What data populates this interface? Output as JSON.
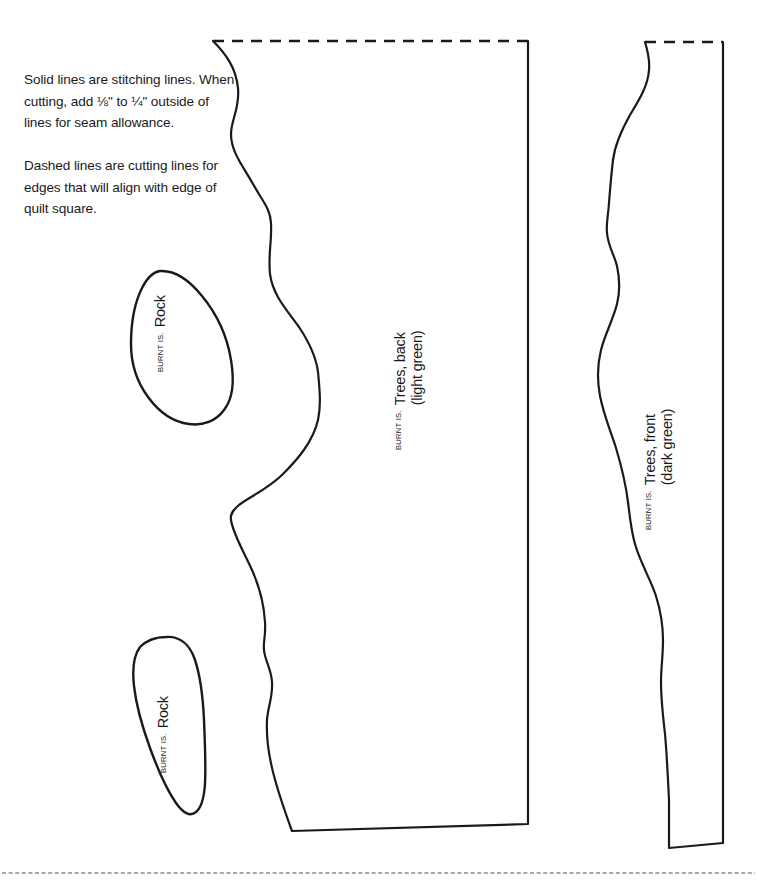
{
  "page": {
    "background": "#ffffff",
    "ink": "#1a1a1a",
    "width": 757,
    "height": 892
  },
  "instructions": {
    "paragraph_1": "Solid lines are stitching lines. When cutting, add ⅛\" to ¼\" outside of lines for seam allowance.",
    "paragraph_2": "Dashed lines are cutting lines for edges that will align with edge of quilt square."
  },
  "pieces": [
    {
      "id": "rock-top",
      "collection": "BURNT IS.",
      "name": "Rock",
      "color_note": "",
      "edges": {
        "solid": true,
        "dashed": false
      }
    },
    {
      "id": "rock-bottom",
      "collection": "BURNT IS.",
      "name": "Rock",
      "color_note": "",
      "edges": {
        "solid": true,
        "dashed": false
      }
    },
    {
      "id": "trees-back",
      "collection": "BURNT IS.",
      "name": "Trees, back",
      "color_note": "(light green)",
      "edges": {
        "solid": true,
        "dashed": true
      }
    },
    {
      "id": "trees-front",
      "collection": "BURNT IS.",
      "name": "Trees, front",
      "color_note": "(dark green)",
      "edges": {
        "solid": true,
        "dashed": true
      }
    }
  ],
  "lines": {
    "stitching_line_color": "#1a1a1a",
    "cutting_line_color": "#1a1a1a",
    "page_fold_line_color": "#8a8a8a"
  }
}
